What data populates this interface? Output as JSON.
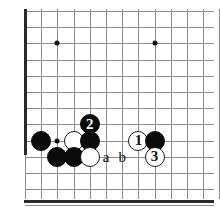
{
  "diagram": {
    "type": "go-board-diagram",
    "board": {
      "grid_spacing_px": 16.2,
      "origin_x_px": 25,
      "origin_y_px": 11,
      "columns": 12,
      "rows": 12,
      "left_edge": true,
      "bottom_edge": true,
      "line_color": "#8c8c8c",
      "edge_color": "#2a2a2a",
      "background": "#ffffff"
    },
    "star_points": [
      {
        "name": "star-point-upper-left",
        "col": 2,
        "row": 2
      },
      {
        "name": "star-point-upper-right",
        "col": 8,
        "row": 2
      },
      {
        "name": "star-point-lower-left",
        "col": 2,
        "row": 8
      },
      {
        "name": "star-point-lower-right",
        "col": 8,
        "row": 8
      }
    ],
    "stones": [
      {
        "id": "black-stone-left",
        "color": "black",
        "col": 1,
        "row": 8,
        "label": ""
      },
      {
        "id": "white-stone-upper-left",
        "color": "white",
        "col": 3,
        "row": 8,
        "label": ""
      },
      {
        "id": "black-stone-move-2",
        "color": "black",
        "col": 4,
        "row": 7,
        "label": "2"
      },
      {
        "id": "black-stone-center",
        "color": "black",
        "col": 4,
        "row": 8,
        "label": ""
      },
      {
        "id": "black-stone-lower-left",
        "color": "black",
        "col": 2,
        "row": 9,
        "label": ""
      },
      {
        "id": "black-stone-lower-mid",
        "color": "black",
        "col": 3,
        "row": 9,
        "label": ""
      },
      {
        "id": "white-stone-lower",
        "color": "white",
        "col": 4,
        "row": 9,
        "label": ""
      },
      {
        "id": "white-stone-move-1",
        "color": "white",
        "col": 7,
        "row": 8,
        "label": "1"
      },
      {
        "id": "black-stone-right",
        "color": "black",
        "col": 8,
        "row": 8,
        "label": ""
      },
      {
        "id": "white-stone-move-3",
        "color": "white",
        "col": 8,
        "row": 9,
        "label": "3"
      }
    ],
    "point_labels": [
      {
        "id": "point-label-a",
        "text": "a",
        "col": 5,
        "row": 9
      },
      {
        "id": "point-label-b",
        "text": "b",
        "col": 6,
        "row": 9
      }
    ]
  }
}
